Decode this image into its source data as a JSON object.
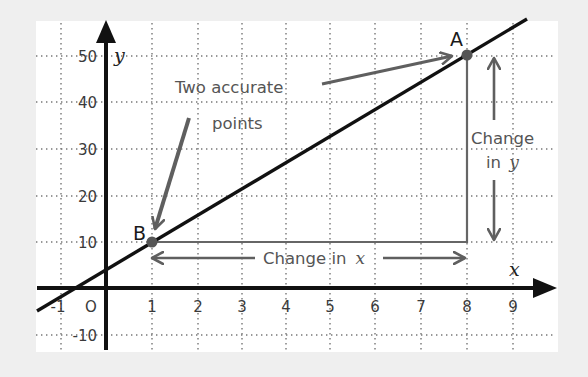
{
  "diagram": {
    "type": "coordinate-graph",
    "x_axis": {
      "label": "x",
      "ticks": [
        "-1",
        "O",
        "1",
        "2",
        "3",
        "4",
        "5",
        "6",
        "7",
        "8",
        "9"
      ]
    },
    "y_axis": {
      "label": "y",
      "ticks": [
        "50",
        "40",
        "30",
        "20",
        "10",
        "-10"
      ]
    },
    "points": [
      {
        "name": "A",
        "x": 8,
        "y": 50
      },
      {
        "name": "B",
        "x": 1,
        "y": 10
      }
    ],
    "annotations": {
      "callout_line1": "Two accurate",
      "callout_line2": "points",
      "change_x_text": "Change in",
      "change_x_var": "x",
      "change_y_line1": "Change",
      "change_y_text": "in",
      "change_y_var": "y"
    },
    "colors": {
      "background": "#efefef",
      "plot": "#ffffff",
      "line": "#111111",
      "annotation": "#5a5a5a",
      "grid": "#777777"
    }
  }
}
